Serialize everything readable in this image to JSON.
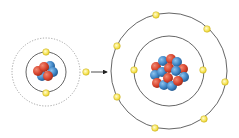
{
  "diagram": {
    "title": "",
    "colors": {
      "orbit": "#555555",
      "dotted_orbit": "#999999",
      "electron_fill": "#f5e14a",
      "electron_stroke": "#c9b020",
      "proton": "#d9452e",
      "neutron": "#3f86c6",
      "arrow": "#222222"
    },
    "small_atom": {
      "center": [
        46,
        72
      ],
      "inner_orbit_radius": 20,
      "outer_dotted_radius": 34,
      "electrons": [
        [
          46,
          52
        ],
        [
          46,
          93
        ]
      ]
    },
    "transfer": {
      "free_electron": [
        86,
        72
      ],
      "arrow_from": [
        91,
        72
      ],
      "arrow_to": [
        109,
        72
      ]
    },
    "large_atom": {
      "center": [
        169,
        71
      ],
      "inner_orbit_radius": 35,
      "outer_orbit_radius": 58,
      "inner_electrons": [
        [
          134,
          70
        ],
        [
          203,
          70
        ]
      ],
      "outer_electrons": [
        [
          156,
          15
        ],
        [
          207,
          29
        ],
        [
          117,
          46
        ],
        [
          225,
          82
        ],
        [
          117,
          97
        ],
        [
          204,
          119
        ],
        [
          155,
          128
        ]
      ]
    }
  }
}
